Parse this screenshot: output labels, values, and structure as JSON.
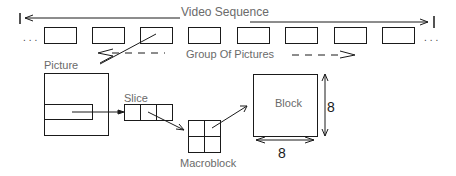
{
  "diagram": {
    "title": "Video Sequence",
    "labels": {
      "video_sequence": "Video Sequence",
      "group_of_pictures": "Group Of Pictures",
      "picture": "Picture",
      "slice": "Slice",
      "macroblock": "Macroblock",
      "block": "Block",
      "block_width": "8",
      "block_height": "8",
      "ellipsis_left": "...",
      "ellipsis_right": "..."
    },
    "gop_frame_count": 8,
    "colors": {
      "stroke": "#1a1a1a",
      "label_text": "#6a6a6a",
      "background": "#ffffff"
    }
  }
}
